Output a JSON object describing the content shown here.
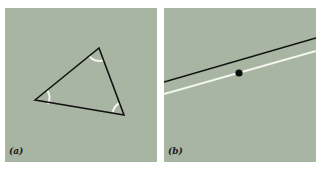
{
  "figure": {
    "background": "#ffffff",
    "panel_color": "#a9b5a3",
    "stroke_dark": "#111111",
    "stroke_light": "#f4f6f0",
    "panels": [
      {
        "id": "a",
        "label": "(a)",
        "description": "triangle with three interior angle arcs",
        "triangle_vertices": [
          [
            30,
            92
          ],
          [
            94,
            40
          ],
          [
            119,
            107
          ]
        ]
      },
      {
        "id": "b",
        "label": "(b)",
        "description": "black line, parallel white line, and point between them",
        "black_line": [
          [
            0,
            74
          ],
          [
            152,
            30
          ]
        ],
        "white_line": [
          [
            0,
            86
          ],
          [
            152,
            43
          ]
        ],
        "point": [
          75,
          65
        ]
      }
    ]
  }
}
